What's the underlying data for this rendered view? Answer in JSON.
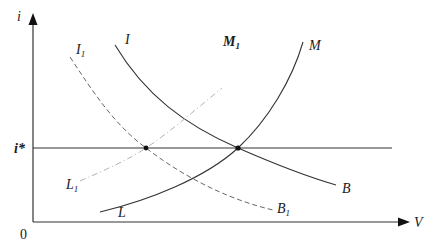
{
  "diagram": {
    "type": "IS-LM-BP style economic diagram",
    "axes": {
      "y_label": "i",
      "x_label": "V",
      "origin_label": "0",
      "reference_line_label": "i*"
    },
    "curves": [
      {
        "id": "I",
        "label": "I",
        "end_label": "B",
        "style": "solid",
        "shape": "downward-sloping"
      },
      {
        "id": "M",
        "label": "M",
        "start_label": "L",
        "style": "solid",
        "shape": "upward-sloping"
      },
      {
        "id": "I1",
        "label": "I",
        "label_sub": "1",
        "end_label": "B",
        "end_label_sub": "1",
        "style": "dashed",
        "shape": "downward-sloping"
      },
      {
        "id": "M1",
        "label": "M",
        "label_sub": "1",
        "start_label": "L",
        "start_label_sub": "1",
        "style": "dash-dot",
        "shape": "upward-sloping"
      }
    ],
    "intersections": [
      {
        "name": "equilibrium-I1-M1",
        "on_line": "i*"
      },
      {
        "name": "equilibrium-I-M",
        "on_line": "i*"
      }
    ]
  }
}
